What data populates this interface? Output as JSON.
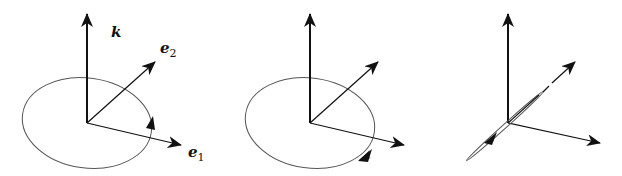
{
  "figure": {
    "panels": [
      {
        "id": "panel-1",
        "labels": {
          "k": "k",
          "e2": "e",
          "e2_sub": "2",
          "e1": "e",
          "e1_sub": "1"
        },
        "rotation_direction": "counterclockwise (arrow on right side pointing up)"
      },
      {
        "id": "panel-2",
        "labels": {},
        "rotation_direction": "clockwise (arrow on lower right pointing down-left)"
      },
      {
        "id": "panel-3",
        "labels": {},
        "rotation_direction": "edge-on ellipse (degenerate, along e2 axis)"
      }
    ],
    "colors": {
      "stroke": "#111111",
      "ellipse": "#555555",
      "background": "#ffffff"
    }
  }
}
